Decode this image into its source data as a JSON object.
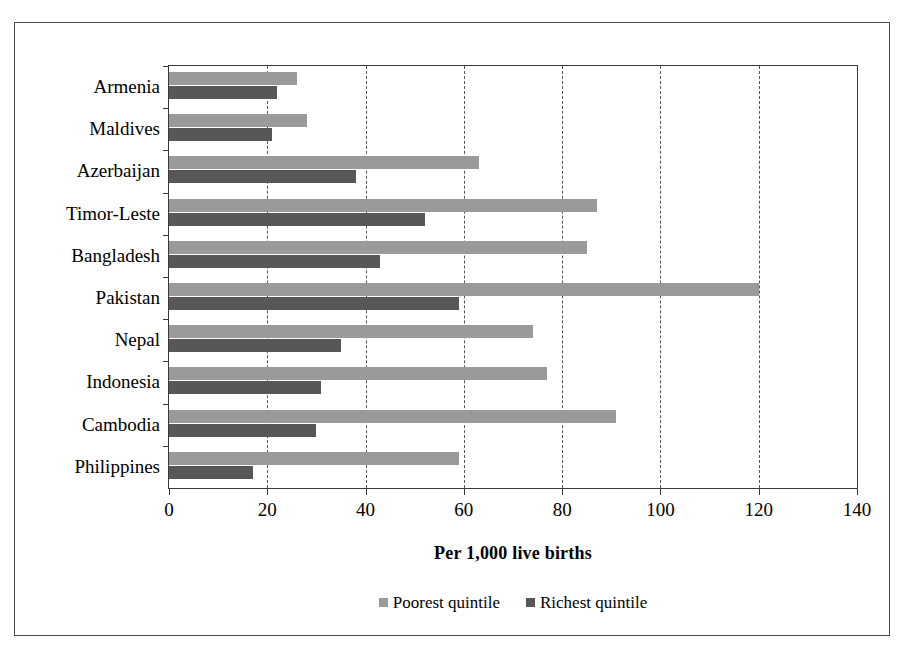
{
  "chart_data": {
    "type": "bar",
    "orientation": "horizontal",
    "title": "",
    "xlabel": "Per 1,000 live births",
    "ylabel": "",
    "xlim": [
      0,
      140
    ],
    "xticks": [
      0,
      20,
      40,
      60,
      80,
      100,
      120,
      140
    ],
    "grid": "vertical-dashed",
    "legend_position": "bottom-center",
    "categories": [
      "Armenia",
      "Maldives",
      "Azerbaijan",
      "Timor-Leste",
      "Bangladesh",
      "Pakistan",
      "Nepal",
      "Indonesia",
      "Cambodia",
      "Philippines"
    ],
    "series": [
      {
        "name": "Poorest quintile",
        "color": "#9a9a9a",
        "values": [
          26,
          28,
          63,
          87,
          85,
          120,
          74,
          77,
          91,
          59
        ]
      },
      {
        "name": "Richest quintile",
        "color": "#575757",
        "values": [
          22,
          21,
          38,
          52,
          43,
          59,
          35,
          31,
          30,
          17
        ]
      }
    ]
  },
  "legend": {
    "items": [
      {
        "label": "Poorest quintile",
        "color": "#9a9a9a"
      },
      {
        "label": "Richest quintile",
        "color": "#575757"
      }
    ]
  }
}
